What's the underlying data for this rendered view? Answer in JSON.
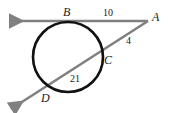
{
  "figure": {
    "type": "geometry-diagram",
    "background_color": "#ffffff",
    "line_color": "#808080",
    "circle_color": "#111111",
    "label_color": "#1a1a1a",
    "points": [
      {
        "id": "A",
        "label": "A",
        "x": 157,
        "y": 18
      },
      {
        "id": "B",
        "label": "B",
        "x": 68,
        "y": 13
      },
      {
        "id": "C",
        "label": "C",
        "x": 108,
        "y": 61
      },
      {
        "id": "D",
        "label": "D",
        "x": 45,
        "y": 99
      }
    ],
    "measures": [
      {
        "id": "AB",
        "label": "10",
        "x": 106,
        "y": 13,
        "segment": "B to A"
      },
      {
        "id": "AC",
        "label": "4",
        "x": 128,
        "y": 41,
        "segment": "C to A"
      },
      {
        "id": "DC",
        "label": "21",
        "x": 73,
        "y": 79,
        "segment": "D to C"
      }
    ],
    "circle": {
      "cx": 68,
      "cy": 57,
      "r": 35
    },
    "tangent_line": {
      "from_x": 8,
      "from_y": 21,
      "to_x": 148,
      "to_y": 21,
      "arrow_at": "left"
    },
    "secant_line": {
      "from_x": 10,
      "from_y": 110,
      "to_x": 148,
      "to_y": 21,
      "arrow_at": "lower-left"
    }
  }
}
